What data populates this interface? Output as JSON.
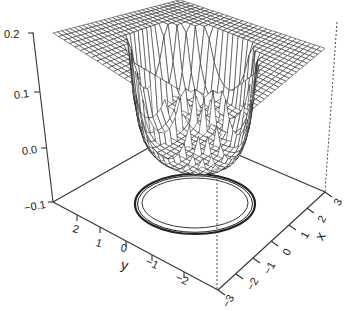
{
  "chart_data": {
    "type": "surface3d",
    "title": "",
    "axes": {
      "x": {
        "label": "x",
        "ticks": [
          -3,
          -2,
          -1,
          0,
          1,
          2,
          3
        ],
        "range": [
          -3,
          3
        ]
      },
      "y": {
        "label": "y",
        "ticks": [
          2,
          1,
          0,
          -1,
          -2
        ],
        "range": [
          -3,
          3
        ]
      },
      "z": {
        "label": "",
        "ticks": [
          0.2,
          0.1,
          0.0,
          -0.1
        ],
        "range": [
          -0.1,
          0.2
        ]
      }
    },
    "surface": {
      "plateau_z": 0.2,
      "well_bottom_z": 0.0,
      "well_radius": 2.0,
      "grid": "wireframe mesh"
    },
    "contours": {
      "plane_z": -0.1,
      "shape": "concentric circles",
      "count_visible": 3
    },
    "grid": false,
    "legend": null
  },
  "labels": {
    "z_ticks": [
      "0.2",
      "0.1",
      "0.0",
      "−0.1"
    ],
    "y_ticks": [
      "2",
      "1",
      "0",
      "−1",
      "−2"
    ],
    "x_ticks": [
      "−3",
      "−2",
      "−1",
      "0",
      "1",
      "2",
      "3"
    ],
    "x_label": "x",
    "y_label": "y"
  }
}
